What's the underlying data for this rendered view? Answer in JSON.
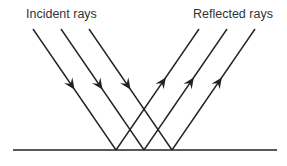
{
  "diagram": {
    "labels": {
      "incident": "Incident rays",
      "reflected": "Reflected rays"
    },
    "colors": {
      "line": "#222222",
      "text": "#333333",
      "background": "#ffffff"
    },
    "surface": {
      "x1": 13,
      "x2": 277,
      "y": 150
    },
    "incident_rays": [
      {
        "x1": 33,
        "y1": 29,
        "x2": 116,
        "y2": 150
      },
      {
        "x1": 61,
        "y1": 29,
        "x2": 144,
        "y2": 150
      },
      {
        "x1": 89,
        "y1": 29,
        "x2": 172,
        "y2": 150
      }
    ],
    "reflected_rays": [
      {
        "x1": 116,
        "y1": 150,
        "x2": 199,
        "y2": 29
      },
      {
        "x1": 144,
        "y1": 150,
        "x2": 227,
        "y2": 29
      },
      {
        "x1": 172,
        "y1": 150,
        "x2": 255,
        "y2": 29
      }
    ]
  }
}
